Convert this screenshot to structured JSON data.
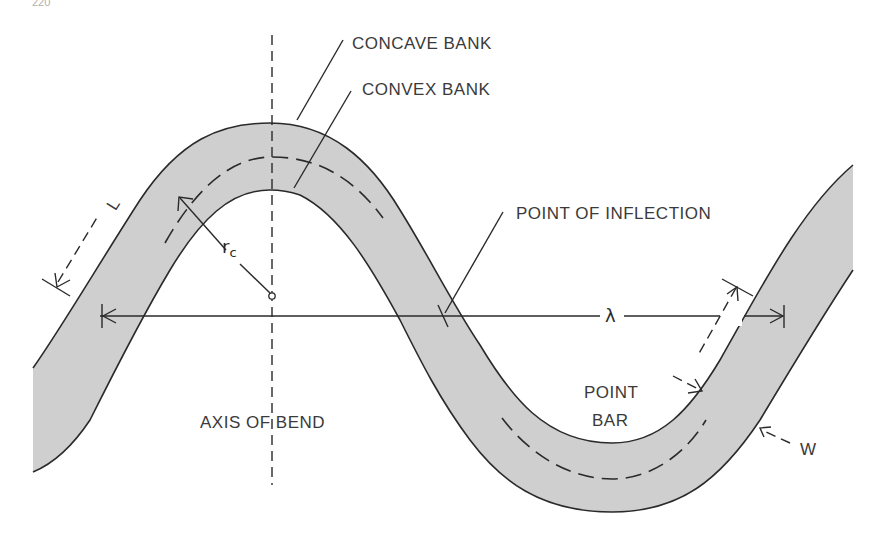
{
  "page_number": "220",
  "diagram": {
    "labels": {
      "concave_bank": "CONCAVE BANK",
      "convex_bank": "CONVEX BANK",
      "point_of_inflection": "POINT OF INFLECTION",
      "axis_of_bend": "AXIS OF BEND",
      "point_bar_line1": "POINT",
      "point_bar_line2": "BAR",
      "channel_length": "L",
      "radius_of_curvature": "r",
      "radius_subscript": "c",
      "wavelength": "λ",
      "channel_width": "W"
    },
    "colors": {
      "channel_fill": "#cfcfcf",
      "line": "#2a2a2a",
      "text": "#3a3a3a",
      "background": "#ffffff"
    }
  }
}
